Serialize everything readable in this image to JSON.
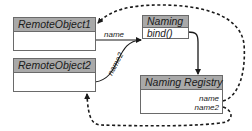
{
  "diagram": {
    "type": "uml-class-relationships",
    "colors": {
      "header_fill": "#a9a9a9",
      "border": "#6a6a6a",
      "line": "#1a1a1a",
      "background": "#ffffff"
    },
    "nodes": [
      {
        "id": "remote1",
        "title": "RemoteObject1",
        "members": []
      },
      {
        "id": "remote2",
        "title": "RemoteObject2",
        "members": []
      },
      {
        "id": "naming",
        "title": "Naming",
        "members": [
          "bind()"
        ]
      },
      {
        "id": "registry",
        "title": "Naming Registry",
        "members": [
          "name",
          "name2"
        ]
      }
    ],
    "edges": [
      {
        "from": "remote1",
        "to": "naming",
        "label": "name",
        "style": "solid",
        "arrow": "end"
      },
      {
        "from": "remote2",
        "to": "naming",
        "label": "name2",
        "style": "solid",
        "arrow": "end"
      },
      {
        "from": "naming",
        "to": "registry",
        "label": "",
        "style": "solid",
        "arrow": "end"
      },
      {
        "from": "registry.name",
        "to": "remote1",
        "label": "",
        "style": "dashed",
        "arrow": "end"
      },
      {
        "from": "registry.name2",
        "to": "remote2",
        "label": "",
        "style": "dashed",
        "arrow": "end"
      }
    ]
  }
}
